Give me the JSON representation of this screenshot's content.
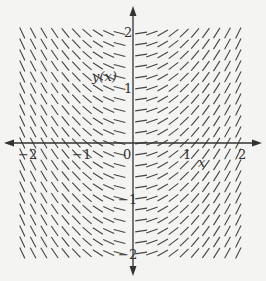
{
  "chart_data": {
    "type": "slope-field",
    "title": "",
    "equation": "dy/dx = x",
    "xlabel": "x",
    "ylabel": "y(x)",
    "xlim": [
      -2,
      2
    ],
    "ylim": [
      -2,
      2
    ],
    "x_ticks": [
      -2,
      -1,
      0,
      1,
      2
    ],
    "y_ticks": [
      -2,
      -1,
      1,
      2
    ],
    "x_tick_labels": [
      "−2",
      "−1",
      "0",
      "1",
      "2"
    ],
    "y_tick_labels": [
      "−2",
      "−1",
      "1",
      "2"
    ],
    "grid_columns": 20,
    "grid_rows": 21,
    "segment_color": "#444444",
    "axis_color": "#333333",
    "background": "#f4f4f2"
  },
  "labels": {
    "x_axis": "x",
    "y_axis": "y(x)",
    "origin": "0",
    "x_neg2": "−2",
    "x_neg1": "−1",
    "x_pos1": "1",
    "x_pos2": "2",
    "y_pos2": "2",
    "y_pos1": "1",
    "y_neg1": "−1",
    "y_neg2": "−2"
  }
}
